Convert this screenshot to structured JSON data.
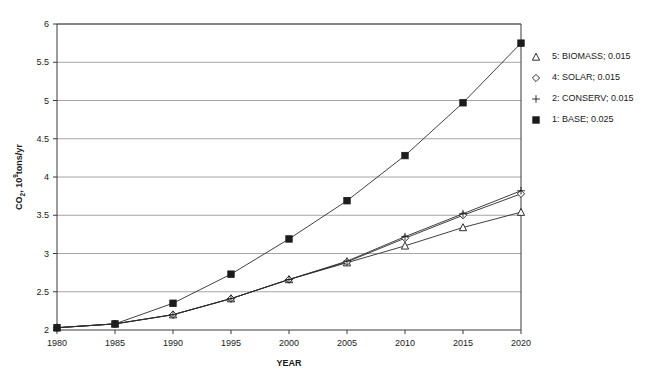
{
  "chart_data": {
    "type": "line",
    "title": "",
    "xlabel": "YEAR",
    "ylabel": "CO2, 10^9 tons/yr",
    "ylabel_parts": {
      "base": "CO",
      "subscript": "2",
      "middle": ", 10",
      "superscript": "9",
      "tail": "tons/yr"
    },
    "x": [
      1980,
      1985,
      1990,
      1995,
      2000,
      2005,
      2010,
      2015,
      2020
    ],
    "xtick_labels": [
      "1980",
      "1985",
      "1990",
      "1995",
      "2000",
      "2005",
      "2010",
      "2015",
      "2020"
    ],
    "ytick_labels": [
      "2",
      "2.5",
      "3",
      "3.5",
      "4",
      "4.5",
      "5",
      "5.5",
      "6"
    ],
    "yticks": [
      2,
      2.5,
      3,
      3.5,
      4,
      4.5,
      5,
      5.5,
      6
    ],
    "xlim": [
      1980,
      2020
    ],
    "ylim": [
      2,
      6
    ],
    "grid": "horizontal",
    "legend_position": "inside-top-right",
    "series": [
      {
        "name": "5: BIOMASS; 0.015",
        "label": "5: BIOMASS; 0.015",
        "marker": "triangle",
        "values": [
          2.03,
          2.08,
          2.2,
          2.41,
          2.66,
          2.88,
          3.1,
          3.34,
          3.54
        ]
      },
      {
        "name": "4: SOLAR; 0.015",
        "label": "4: SOLAR; 0.015",
        "marker": "diamond",
        "values": [
          2.03,
          2.08,
          2.2,
          2.41,
          2.66,
          2.89,
          3.2,
          3.5,
          3.78
        ]
      },
      {
        "name": "2: CONSERV; 0.015",
        "label": "2: CONSERV; 0.015",
        "marker": "plus",
        "values": [
          2.03,
          2.08,
          2.2,
          2.41,
          2.66,
          2.9,
          3.22,
          3.52,
          3.82
        ]
      },
      {
        "name": "1: BASE; 0.025",
        "label": "1: BASE; 0.025",
        "marker": "square-filled",
        "values": [
          2.03,
          2.08,
          2.35,
          2.73,
          3.19,
          3.69,
          4.28,
          4.97,
          5.75
        ]
      }
    ],
    "colors": {
      "line": "#2b2b2b",
      "grid": "#8d8d8d",
      "axis": "#3a3a3a",
      "text": "#1a1a1a",
      "background": "#ffffff"
    }
  }
}
